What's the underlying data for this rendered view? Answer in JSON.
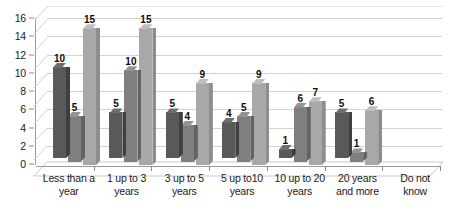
{
  "chart_data": {
    "type": "bar",
    "title": "",
    "subtitle": "",
    "xlabel": "",
    "ylabel": "",
    "ylim": [
      0,
      16
    ],
    "ytick_labels": [
      "16",
      "14",
      "12",
      "10",
      "8",
      "6",
      "4",
      "2",
      "0"
    ],
    "ytick_values": [
      16,
      14,
      12,
      10,
      8,
      6,
      4,
      2,
      0
    ],
    "grid": true,
    "legend": "none",
    "style": "3d-clustered-column",
    "categories": [
      "Less than a year",
      "1  up to 3 years",
      "3  up to 5 years",
      "5  up to10 years",
      "10 up to 20 years",
      "20 years and more",
      "Do not know"
    ],
    "category_lines": [
      [
        "Less than a",
        "year"
      ],
      [
        "1  up to 3",
        "years"
      ],
      [
        "3  up to 5",
        "years"
      ],
      [
        "5  up to10",
        "years"
      ],
      [
        "10 up to 20",
        "years"
      ],
      [
        "20 years",
        "and more"
      ],
      [
        "Do not",
        "know"
      ]
    ],
    "series": [
      {
        "name": "Series 1",
        "color": "#595959",
        "values": [
          10,
          5,
          5,
          4,
          1,
          5,
          0
        ]
      },
      {
        "name": "Series 2",
        "color": "#7f7f7f",
        "values": [
          5,
          10,
          4,
          5,
          6,
          1,
          0
        ]
      },
      {
        "name": "Series 3",
        "color": "#a8a8a8",
        "values": [
          15,
          15,
          9,
          9,
          7,
          6,
          0
        ]
      }
    ],
    "data_labels": [
      [
        "10",
        "5",
        "15"
      ],
      [
        "5",
        "10",
        "15"
      ],
      [
        "5",
        "4",
        "9"
      ],
      [
        "4",
        "5",
        "9"
      ],
      [
        "1",
        "6",
        "7"
      ],
      [
        "5",
        "1",
        "6"
      ],
      [
        "",
        "",
        ""
      ]
    ]
  },
  "colors": {
    "series_dark": "#595959",
    "series_medium": "#7f7f7f",
    "series_light": "#a8a8a8",
    "gridline": "#d2d2d2",
    "axis": "#9a9a9a",
    "text": "#1a1a1a",
    "background": "#ffffff"
  }
}
